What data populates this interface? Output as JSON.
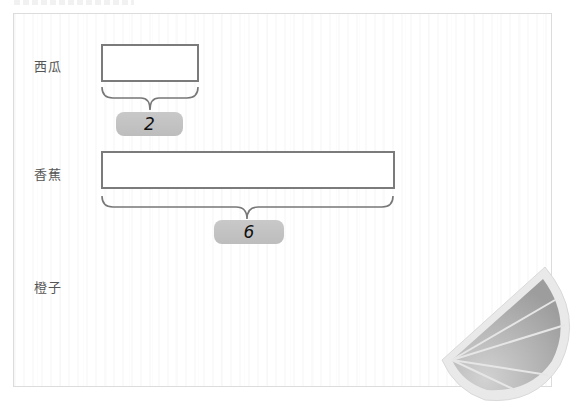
{
  "diagram": {
    "rows": [
      {
        "label": "西瓜",
        "count_label": "2",
        "units": 2
      },
      {
        "label": "香蕉",
        "count_label": "6",
        "units": 6
      },
      {
        "label": "橙子",
        "count_label": "",
        "units": null
      }
    ],
    "decoration": "orange-slice-image",
    "colors": {
      "bar_border": "#7b7b7b",
      "pill_fill": "#c4c4c4",
      "label_text": "#555555",
      "brace": "#777777"
    }
  }
}
